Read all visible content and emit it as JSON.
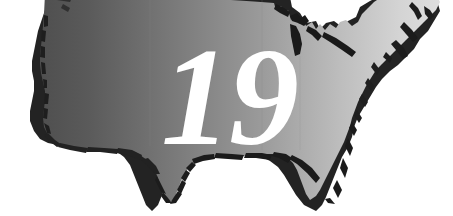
{
  "graphic": {
    "kind": "map-illustration",
    "subject": "continental-united-states",
    "overlay_number": "19",
    "overlay_number_color": "#ffffff",
    "background_color": "#ffffff",
    "fill_gradient": {
      "start_color": "#555555",
      "mid_color": "#9a9a9a",
      "end_color": "#dcdcdc",
      "direction": "left-to-right"
    },
    "shadow_color": "#262626",
    "outline_color": "#1c1c1c",
    "canvas": {
      "width": "453",
      "height": "216"
    }
  },
  "labels": {
    "title": "19",
    "alt_text": "Map of the continental United States with the number 19"
  }
}
